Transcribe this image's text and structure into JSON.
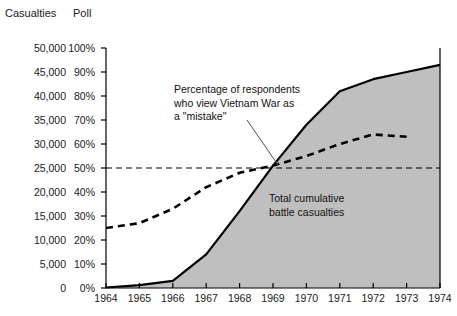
{
  "header": {
    "left_axis_title": "Casualties",
    "right_axis_title": "Poll"
  },
  "annotations": {
    "poll_line": "Percentage of respondents\nwho view Vietnam War as\na \"mistake\"",
    "area": "Total cumulative\nbattle casualties"
  },
  "colors": {
    "area_fill": "#bfbfbf",
    "area_stroke": "#000000",
    "poll_line": "#000000",
    "reference_line": "#000000",
    "axis": "#000000",
    "text": "#1a1a1a"
  },
  "chart_data": {
    "type": "area",
    "title": "",
    "subtitle": "",
    "xlabel": "",
    "ylabel": "Casualties",
    "y2label": "Poll",
    "grid": false,
    "legend": "none",
    "x": [
      1964,
      1965,
      1966,
      1967,
      1968,
      1969,
      1970,
      1971,
      1972,
      1973,
      1974
    ],
    "xlim": [
      1964,
      1974
    ],
    "xticks": [
      "1964",
      "1965",
      "1966",
      "1967",
      "1968",
      "1969",
      "1970",
      "1971",
      "1972",
      "1973",
      "1974"
    ],
    "ylim": [
      0,
      50000
    ],
    "yticks": [
      "0",
      "5,000",
      "10,000",
      "15,000",
      "20,000",
      "25,000",
      "30,000",
      "35,000",
      "40,000",
      "45,000",
      "50,000"
    ],
    "ytick_values": [
      0,
      5000,
      10000,
      15000,
      20000,
      25000,
      30000,
      35000,
      40000,
      45000,
      50000
    ],
    "y2lim": [
      0,
      100
    ],
    "y2ticks": [
      "0%",
      "10%",
      "20%",
      "30%",
      "40%",
      "50%",
      "60%",
      "70%",
      "80%",
      "90%",
      "100%"
    ],
    "y2tick_values": [
      0,
      10,
      20,
      30,
      40,
      50,
      60,
      70,
      80,
      90,
      100
    ],
    "reference_line": {
      "axis": "y2",
      "value": 50,
      "style": "dashed",
      "label": "50%"
    },
    "series": [
      {
        "name": "Total cumulative battle casualties",
        "type": "area",
        "axis": "y1",
        "style": "solid-filled",
        "x": [
          1964,
          1965,
          1966,
          1967,
          1968,
          1969,
          1970,
          1971,
          1972,
          1973,
          1974
        ],
        "values": [
          100,
          600,
          1500,
          7000,
          16000,
          25500,
          34000,
          41000,
          43500,
          45000,
          46500
        ]
      },
      {
        "name": "Percentage of respondents who view Vietnam War as a \"mistake\"",
        "type": "line",
        "axis": "y2",
        "style": "dashed",
        "x": [
          1964,
          1965,
          1966,
          1967,
          1968,
          1969,
          1970,
          1971,
          1972,
          1973
        ],
        "values": [
          25,
          27,
          33,
          42,
          48,
          51,
          55,
          60,
          64,
          63
        ]
      }
    ]
  }
}
